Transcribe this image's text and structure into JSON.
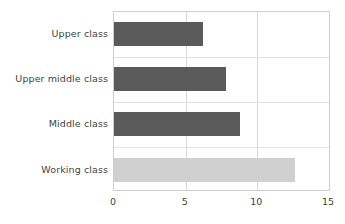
{
  "chart_data": {
    "type": "bar",
    "orientation": "horizontal",
    "title": "",
    "subtitle": "",
    "xlabel": "",
    "ylabel": "",
    "categories": [
      "Upper class",
      "Upper middle class",
      "Middle class",
      "Working class"
    ],
    "values": [
      6.2,
      7.8,
      8.8,
      12.6
    ],
    "bar_colors": [
      "#5a5a5a",
      "#5a5a5a",
      "#5a5a5a",
      "#d0d0d0"
    ],
    "xlim": [
      0,
      15
    ],
    "xticks": [
      0,
      5,
      10,
      15
    ],
    "xtick_labels": [
      "0",
      "5",
      "10",
      "15"
    ],
    "grid": true,
    "grid_axis": "x",
    "legend": false,
    "legend_position": "none"
  },
  "style": {
    "background": "#ffffff",
    "axis_color": "#cfcfcf",
    "gridline_color": "#d8d8d8",
    "text_color": "#3f3f3f",
    "bar_dark": "#5a5a5a",
    "bar_light": "#d0d0d0"
  }
}
